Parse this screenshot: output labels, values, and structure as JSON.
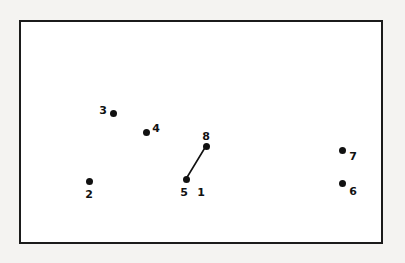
{
  "figure": {
    "type": "point-diagram",
    "background_color": "#f4f3f1",
    "panel_color": "#ffffff",
    "border_color": "#1b1b1b",
    "mark_color": "#111111",
    "panel": {
      "x": 19,
      "y": 20,
      "width": 364,
      "height": 224
    }
  },
  "nodes": [
    {
      "label": "1",
      "dot": null,
      "label_pos": {
        "x": 201,
        "y": 192
      }
    },
    {
      "label": "2",
      "dot": {
        "x": 89,
        "y": 181
      },
      "label_pos": {
        "x": 89,
        "y": 194
      }
    },
    {
      "label": "3",
      "dot": {
        "x": 113,
        "y": 113
      },
      "label_pos": {
        "x": 103,
        "y": 110
      }
    },
    {
      "label": "4",
      "dot": {
        "x": 146,
        "y": 132
      },
      "label_pos": {
        "x": 156,
        "y": 128
      }
    },
    {
      "label": "5",
      "dot": {
        "x": 186,
        "y": 179
      },
      "label_pos": {
        "x": 184,
        "y": 192
      }
    },
    {
      "label": "6",
      "dot": {
        "x": 342,
        "y": 183
      },
      "label_pos": {
        "x": 353,
        "y": 191
      }
    },
    {
      "label": "7",
      "dot": {
        "x": 342,
        "y": 150
      },
      "label_pos": {
        "x": 353,
        "y": 156
      }
    },
    {
      "label": "8",
      "dot": {
        "x": 206,
        "y": 146
      },
      "label_pos": {
        "x": 206,
        "y": 136
      }
    }
  ],
  "edges": [
    {
      "from": "5",
      "to": "8",
      "x1": 186,
      "y1": 179,
      "x2": 206,
      "y2": 146,
      "width": 1.6
    }
  ],
  "chart_data": {
    "type": "scatter",
    "title": "",
    "xlabel": "",
    "ylabel": "",
    "points": [
      {
        "id": "2",
        "x": 89,
        "y": 181
      },
      {
        "id": "3",
        "x": 113,
        "y": 113
      },
      {
        "id": "4",
        "x": 146,
        "y": 132
      },
      {
        "id": "5",
        "x": 186,
        "y": 179
      },
      {
        "id": "6",
        "x": 342,
        "y": 183
      },
      {
        "id": "7",
        "x": 342,
        "y": 150
      },
      {
        "id": "8",
        "x": 206,
        "y": 146
      }
    ],
    "labels": [
      "1",
      "2",
      "3",
      "4",
      "5",
      "6",
      "7",
      "8"
    ],
    "connections": [
      [
        "5",
        "8"
      ]
    ],
    "grid": false,
    "legend": null
  }
}
